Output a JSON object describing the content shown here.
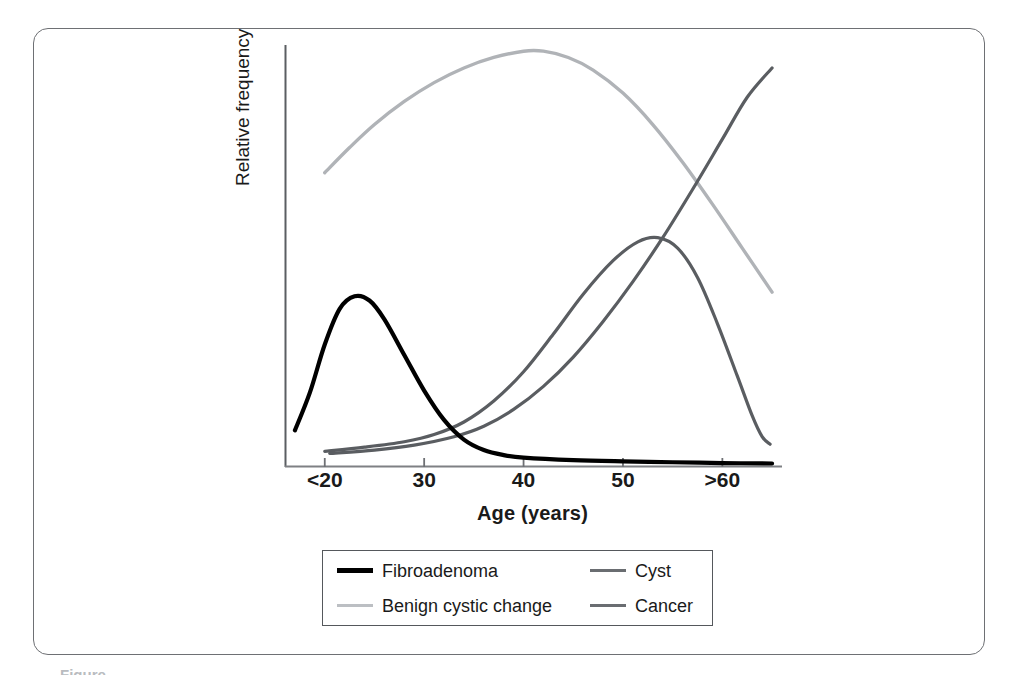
{
  "figure": {
    "frame_color": "#6e7074",
    "background": "#ffffff",
    "caption_sliver": "Figure"
  },
  "chart_data": {
    "type": "line",
    "title": "",
    "subtitle": "",
    "xlabel": "Age (years)",
    "ylabel": "Relative frequency",
    "grid": false,
    "legend_position": "bottom",
    "xlim": [
      16,
      66
    ],
    "ylim": [
      0,
      1
    ],
    "x_tick_values": [
      20,
      30,
      40,
      50,
      60
    ],
    "x_tick_labels": [
      "<20",
      "30",
      "40",
      "50",
      ">60"
    ],
    "y_tick_labels": [],
    "axis_note": "Y axis is unlabeled (relative frequency, arbitrary units)",
    "series": [
      {
        "name": "Fibroadenoma",
        "color": "#000000",
        "width": 4.2,
        "description": "Sharp peak in the early twenties, decaying to near zero after age 40",
        "points": [
          {
            "x": 17.0,
            "y": 0.085
          },
          {
            "x": 18.5,
            "y": 0.175
          },
          {
            "x": 20.0,
            "y": 0.29
          },
          {
            "x": 21.5,
            "y": 0.375
          },
          {
            "x": 23.0,
            "y": 0.405
          },
          {
            "x": 24.5,
            "y": 0.395
          },
          {
            "x": 26.0,
            "y": 0.35
          },
          {
            "x": 28.0,
            "y": 0.265
          },
          {
            "x": 30.0,
            "y": 0.18
          },
          {
            "x": 32.0,
            "y": 0.11
          },
          {
            "x": 34.0,
            "y": 0.063
          },
          {
            "x": 36.0,
            "y": 0.038
          },
          {
            "x": 38.0,
            "y": 0.026
          },
          {
            "x": 40.0,
            "y": 0.02
          },
          {
            "x": 45.0,
            "y": 0.014
          },
          {
            "x": 50.0,
            "y": 0.011
          },
          {
            "x": 55.0,
            "y": 0.009
          },
          {
            "x": 60.0,
            "y": 0.007
          },
          {
            "x": 65.0,
            "y": 0.006
          }
        ]
      },
      {
        "name": "Cyst",
        "color": "#5a5d61",
        "width": 3.2,
        "description": "Low and flat until the late thirties, rising to a peak in the early fifties then falling steeply",
        "points": [
          {
            "x": 20.0,
            "y": 0.035
          },
          {
            "x": 24.0,
            "y": 0.045
          },
          {
            "x": 28.0,
            "y": 0.058
          },
          {
            "x": 31.0,
            "y": 0.075
          },
          {
            "x": 34.0,
            "y": 0.105
          },
          {
            "x": 37.0,
            "y": 0.155
          },
          {
            "x": 40.0,
            "y": 0.225
          },
          {
            "x": 43.0,
            "y": 0.315
          },
          {
            "x": 46.0,
            "y": 0.41
          },
          {
            "x": 49.0,
            "y": 0.49
          },
          {
            "x": 51.5,
            "y": 0.535
          },
          {
            "x": 53.5,
            "y": 0.545
          },
          {
            "x": 55.5,
            "y": 0.52
          },
          {
            "x": 57.5,
            "y": 0.45
          },
          {
            "x": 59.5,
            "y": 0.34
          },
          {
            "x": 61.5,
            "y": 0.215
          },
          {
            "x": 63.0,
            "y": 0.12
          },
          {
            "x": 64.0,
            "y": 0.07
          },
          {
            "x": 64.8,
            "y": 0.052
          }
        ]
      },
      {
        "name": "Benign cystic change",
        "color": "#b0b3b7",
        "width": 3.4,
        "description": "Rises steeply from age 20 to a broad peak around age 41, then declines through age 65",
        "points": [
          {
            "x": 20.0,
            "y": 0.7
          },
          {
            "x": 22.5,
            "y": 0.76
          },
          {
            "x": 25.0,
            "y": 0.815
          },
          {
            "x": 28.0,
            "y": 0.87
          },
          {
            "x": 31.0,
            "y": 0.915
          },
          {
            "x": 34.0,
            "y": 0.95
          },
          {
            "x": 37.0,
            "y": 0.975
          },
          {
            "x": 40.0,
            "y": 0.99
          },
          {
            "x": 42.0,
            "y": 0.99
          },
          {
            "x": 44.5,
            "y": 0.975
          },
          {
            "x": 47.0,
            "y": 0.945
          },
          {
            "x": 50.0,
            "y": 0.89
          },
          {
            "x": 53.0,
            "y": 0.815
          },
          {
            "x": 56.0,
            "y": 0.725
          },
          {
            "x": 59.0,
            "y": 0.625
          },
          {
            "x": 62.0,
            "y": 0.52
          },
          {
            "x": 65.0,
            "y": 0.415
          }
        ]
      },
      {
        "name": "Cancer",
        "color": "#5a5d61",
        "width": 3.2,
        "description": "Very low before 35, then rising exponentially and steeply through age 65",
        "points": [
          {
            "x": 20.5,
            "y": 0.03
          },
          {
            "x": 25.0,
            "y": 0.038
          },
          {
            "x": 29.0,
            "y": 0.05
          },
          {
            "x": 33.0,
            "y": 0.07
          },
          {
            "x": 36.0,
            "y": 0.095
          },
          {
            "x": 39.0,
            "y": 0.135
          },
          {
            "x": 42.0,
            "y": 0.19
          },
          {
            "x": 45.0,
            "y": 0.26
          },
          {
            "x": 48.0,
            "y": 0.345
          },
          {
            "x": 51.0,
            "y": 0.44
          },
          {
            "x": 54.0,
            "y": 0.545
          },
          {
            "x": 57.0,
            "y": 0.66
          },
          {
            "x": 60.0,
            "y": 0.78
          },
          {
            "x": 62.5,
            "y": 0.88
          },
          {
            "x": 65.0,
            "y": 0.95
          }
        ]
      }
    ]
  },
  "legend": {
    "items": [
      {
        "label": "Fibroadenoma",
        "color": "#000000",
        "width": 5
      },
      {
        "label": "Cyst",
        "color": "#6a6d71",
        "width": 3
      },
      {
        "label": "Benign cystic change",
        "color": "#bcbfc3",
        "width": 3
      },
      {
        "label": "Cancer",
        "color": "#6a6d71",
        "width": 3
      }
    ]
  }
}
